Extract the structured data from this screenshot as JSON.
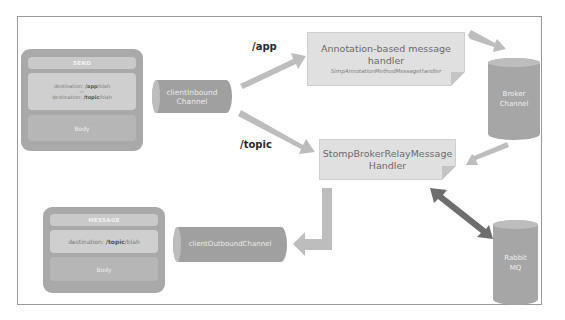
{
  "diagram": {
    "send_frame": {
      "title": "SEND",
      "destination_prefix": "destination: ",
      "destination_app": "/app",
      "destination_app_suffix": "/blah",
      "or_label": "or",
      "destination_topic": "/topic",
      "destination_topic_suffix": "/blah",
      "body_label": "Body"
    },
    "message_frame": {
      "title": "MESSAGE",
      "destination_prefix": "destination: ",
      "destination_topic": "/topic",
      "destination_topic_suffix": "/blah",
      "body_label": "Body"
    },
    "channels": {
      "client_inbound": "clientInbound Channel",
      "client_outbound": "clientOutboundChannel",
      "broker": "Broker Channel",
      "rabbit": "Rabbit MQ"
    },
    "handlers": {
      "annotation": {
        "title": "Annotation-based message handler",
        "class_name": "SimpAnnotationMethodMessageHandler"
      },
      "relay": {
        "title": "StompBrokerRelayMessage Handler"
      }
    },
    "routes": {
      "app": "/app",
      "topic": "/topic"
    },
    "colors": {
      "arrow": "#bdbdbd",
      "bidirectional_arrow": "#6e6e6e",
      "cylinder": "#a6a6a6",
      "handler_fill": "#e0e0e0",
      "frame_border": "#9a9a9a"
    }
  }
}
